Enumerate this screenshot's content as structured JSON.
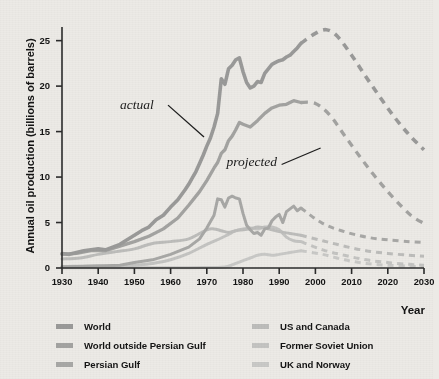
{
  "chart_data": {
    "type": "line",
    "title": "",
    "xlabel": "Year",
    "ylabel": "Annual oil production (billions of barrels)",
    "xlim": [
      1930,
      2030
    ],
    "ylim": [
      0,
      26.5
    ],
    "xticks": [
      1930,
      1940,
      1950,
      1960,
      1970,
      1980,
      1990,
      2000,
      2010,
      2020,
      2030
    ],
    "yticks": [
      0,
      5,
      10,
      15,
      20,
      25
    ],
    "grid": false,
    "legend_position": "bottom",
    "annotations": [
      {
        "text": "actual",
        "x": 1951,
        "y": 17.8,
        "style": "italic-serif"
      },
      {
        "text": "projected",
        "x": 1981,
        "y": 11.6,
        "style": "italic-serif"
      }
    ],
    "series": [
      {
        "name": "World",
        "color": "#9a9a99",
        "actual": {
          "x": [
            1930,
            1932,
            1934,
            1936,
            1938,
            1940,
            1942,
            1944,
            1946,
            1948,
            1950,
            1952,
            1954,
            1956,
            1958,
            1960,
            1962,
            1964,
            1965,
            1966,
            1967,
            1968,
            1969,
            1970,
            1971,
            1972,
            1973,
            1974,
            1975,
            1976,
            1977,
            1978,
            1979,
            1980,
            1981,
            1982,
            1983,
            1984,
            1985,
            1986,
            1987,
            1988,
            1989,
            1990,
            1991,
            1992,
            1993,
            1994,
            1995,
            1996
          ],
          "y": [
            1.6,
            1.5,
            1.7,
            1.9,
            2.0,
            2.1,
            2.0,
            2.3,
            2.6,
            3.1,
            3.6,
            4.1,
            4.5,
            5.3,
            5.8,
            6.7,
            7.5,
            8.6,
            9.2,
            9.9,
            10.6,
            11.5,
            12.4,
            13.4,
            14.3,
            15.5,
            17.0,
            20.8,
            20.2,
            21.9,
            22.3,
            22.9,
            23.1,
            21.6,
            20.4,
            19.8,
            20.0,
            20.5,
            20.4,
            21.4,
            21.9,
            22.4,
            22.6,
            22.8,
            22.9,
            23.2,
            23.4,
            23.8,
            24.2,
            24.7
          ]
        },
        "projected": {
          "x": [
            1996,
            2000,
            2003,
            2006,
            2010,
            2014,
            2018,
            2022,
            2026,
            2030
          ],
          "y": [
            24.7,
            25.8,
            26.2,
            25.5,
            23.4,
            21.0,
            18.7,
            16.5,
            14.6,
            13.0
          ]
        }
      },
      {
        "name": "World outside Persian Gulf",
        "color": "#a3a3a1",
        "actual": {
          "x": [
            1930,
            1934,
            1938,
            1942,
            1946,
            1950,
            1954,
            1958,
            1962,
            1965,
            1968,
            1970,
            1972,
            1973,
            1974,
            1975,
            1976,
            1977,
            1978,
            1979,
            1980,
            1982,
            1984,
            1986,
            1988,
            1990,
            1992,
            1994,
            1996
          ],
          "y": [
            1.5,
            1.6,
            1.9,
            1.9,
            2.4,
            2.9,
            3.5,
            4.3,
            5.5,
            6.9,
            8.4,
            9.6,
            11.0,
            11.6,
            12.6,
            13.0,
            14.0,
            14.5,
            15.2,
            16.0,
            15.8,
            15.5,
            16.2,
            17.0,
            17.6,
            17.9,
            18.0,
            18.4,
            18.2
          ]
        },
        "projected": {
          "x": [
            1996,
            2000,
            2004,
            2008,
            2012,
            2016,
            2020,
            2024,
            2027,
            2030
          ],
          "y": [
            18.2,
            18.1,
            16.8,
            14.6,
            12.4,
            10.3,
            8.4,
            6.7,
            5.6,
            4.9
          ]
        }
      },
      {
        "name": "Persian Gulf",
        "color": "#a8a8a6",
        "actual": {
          "x": [
            1930,
            1938,
            1946,
            1950,
            1955,
            1960,
            1965,
            1968,
            1970,
            1972,
            1973,
            1974,
            1975,
            1976,
            1977,
            1978,
            1979,
            1980,
            1981,
            1982,
            1983,
            1984,
            1985,
            1986,
            1987,
            1988,
            1989,
            1990,
            1991,
            1992,
            1993,
            1994,
            1995,
            1996
          ],
          "y": [
            0.15,
            0.2,
            0.3,
            0.6,
            0.9,
            1.5,
            2.3,
            3.2,
            4.4,
            5.8,
            7.6,
            7.5,
            6.7,
            7.7,
            7.9,
            7.7,
            7.6,
            6.0,
            4.7,
            4.2,
            3.8,
            3.9,
            3.6,
            4.3,
            4.4,
            5.2,
            5.6,
            5.9,
            5.0,
            6.2,
            6.5,
            6.8,
            6.3,
            6.6
          ]
        },
        "projected": {
          "x": [
            1996,
            2002,
            2008,
            2014,
            2020,
            2026,
            2030
          ],
          "y": [
            6.6,
            4.9,
            4.0,
            3.4,
            3.1,
            2.9,
            2.8
          ]
        }
      },
      {
        "name": "US and Canada",
        "color": "#bdbdbb",
        "actual": {
          "x": [
            1930,
            1935,
            1940,
            1945,
            1950,
            1955,
            1960,
            1965,
            1970,
            1972,
            1974,
            1976,
            1978,
            1980,
            1982,
            1984,
            1986,
            1988,
            1990,
            1993,
            1996
          ],
          "y": [
            1.0,
            1.1,
            1.5,
            1.8,
            2.1,
            2.7,
            2.9,
            3.2,
            4.2,
            4.3,
            4.1,
            3.9,
            4.1,
            4.2,
            4.3,
            4.5,
            4.4,
            4.2,
            4.0,
            3.8,
            3.6
          ]
        },
        "projected": {
          "x": [
            1996,
            2002,
            2008,
            2014,
            2020,
            2026,
            2030
          ],
          "y": [
            3.6,
            3.0,
            2.4,
            1.9,
            1.6,
            1.4,
            1.3
          ]
        }
      },
      {
        "name": "Former Soviet Union",
        "color": "#c4c4c2",
        "actual": {
          "x": [
            1930,
            1935,
            1940,
            1945,
            1950,
            1955,
            1960,
            1965,
            1970,
            1974,
            1976,
            1978,
            1980,
            1982,
            1984,
            1986,
            1988,
            1990,
            1992,
            1994,
            1996
          ],
          "y": [
            0.15,
            0.2,
            0.25,
            0.15,
            0.3,
            0.5,
            0.9,
            1.6,
            2.6,
            3.3,
            3.7,
            4.1,
            4.3,
            4.4,
            4.3,
            4.5,
            4.5,
            4.2,
            3.4,
            3.0,
            2.9
          ]
        },
        "projected": {
          "x": [
            1996,
            2002,
            2008,
            2014,
            2020,
            2026,
            2030
          ],
          "y": [
            2.9,
            2.0,
            1.4,
            0.9,
            0.6,
            0.4,
            0.3
          ]
        }
      },
      {
        "name": "UK and Norway",
        "color": "#c9c9c7",
        "actual": {
          "x": [
            1930,
            1950,
            1965,
            1970,
            1974,
            1976,
            1978,
            1980,
            1982,
            1984,
            1986,
            1988,
            1990,
            1993,
            1996
          ],
          "y": [
            0.02,
            0.02,
            0.03,
            0.05,
            0.08,
            0.2,
            0.5,
            0.8,
            1.1,
            1.4,
            1.5,
            1.4,
            1.5,
            1.7,
            1.9
          ]
        },
        "projected": {
          "x": [
            1996,
            2002,
            2008,
            2014,
            2020,
            2026,
            2030
          ],
          "y": [
            1.9,
            1.5,
            0.9,
            0.5,
            0.3,
            0.2,
            0.15
          ]
        }
      }
    ]
  },
  "legend": {
    "columns": [
      {
        "items": [
          {
            "label": "World",
            "color": "#9a9a99"
          },
          {
            "label": "World outside Persian Gulf",
            "color": "#a3a3a1"
          },
          {
            "label": "Persian Gulf",
            "color": "#a8a8a6"
          }
        ]
      },
      {
        "items": [
          {
            "label": "US and Canada",
            "color": "#bdbdbb"
          },
          {
            "label": "Former Soviet Union",
            "color": "#c4c4c2"
          },
          {
            "label": "UK and Norway",
            "color": "#c9c9c7"
          }
        ]
      }
    ]
  },
  "axes": {
    "y_title": "Annual oil production (billions of barrels)",
    "x_title": "Year",
    "y_tick_labels": [
      "25",
      "20",
      "15",
      "10",
      "5",
      "0"
    ],
    "x_tick_labels": [
      "1930",
      "1940",
      "1950",
      "1960",
      "1970",
      "1980",
      "1990",
      "2000",
      "2010",
      "2020",
      "2030"
    ]
  },
  "annotations": {
    "actual": "actual",
    "projected": "projected"
  },
  "colors": {
    "background": "#eceae6",
    "axis": "#2b2b2b",
    "text": "#141414",
    "leader_line": "#1d1d1d"
  }
}
